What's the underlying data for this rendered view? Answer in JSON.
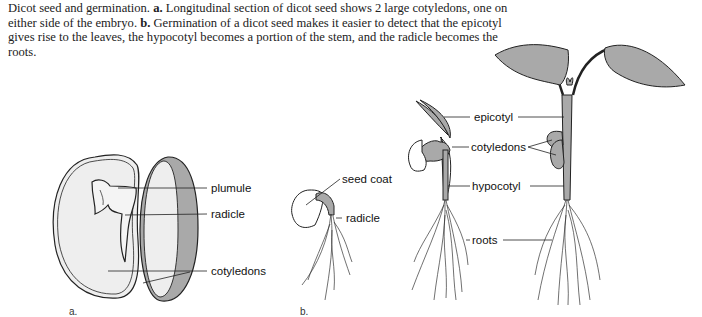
{
  "caption": {
    "title": "Dicot seed and germination.",
    "part_a_marker": "a.",
    "part_a_text": "Longitudinal section of dicot seed shows 2 large cotyledons, one on either side of the embryo.",
    "part_b_marker": "b.",
    "part_b_text": "Germination of a dicot seed makes it easier to detect that the epicotyl gives rise to the leaves, the hypocotyl becomes a portion of the stem, and the radicle becomes the roots."
  },
  "panel_a": {
    "marker": "a.",
    "labels": {
      "plumule": "plumule",
      "radicle": "radicle",
      "cotyledons": "cotyledons"
    }
  },
  "panel_b": {
    "marker": "b.",
    "labels": {
      "seed_coat": "seed coat",
      "radicle": "radicle",
      "epicotyl": "epicotyl",
      "cotyledons": "cotyledons",
      "hypocotyl": "hypocotyl",
      "roots": "roots"
    }
  },
  "colors": {
    "fill_gray": "#a9a9a9",
    "fill_light": "#eeeeee",
    "outline": "#222222"
  }
}
